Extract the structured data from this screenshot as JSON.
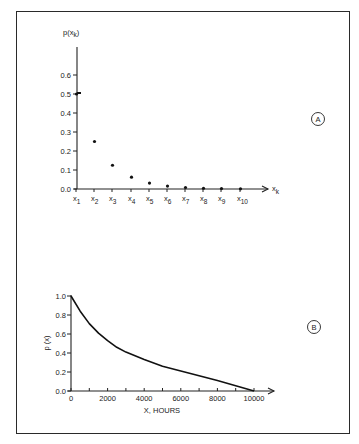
{
  "chart_data": [
    {
      "id": "A",
      "type": "scatter",
      "title": "",
      "panel_label": "A",
      "ylabel": "p(x_k)",
      "ylabel_main": "p(x",
      "ylabel_sub": "k",
      "ylabel_close": ")",
      "xlabel": "x_k",
      "xlabel_main": "x",
      "xlabel_sub": "k",
      "ylim": [
        0,
        0.7
      ],
      "yticks": [
        0.0,
        0.1,
        0.2,
        0.3,
        0.4,
        0.5,
        0.6
      ],
      "ytick_labels": [
        "0.0",
        "0.1",
        "0.2",
        "0.3",
        "0.4",
        "0.5",
        "0.6"
      ],
      "categories": [
        "x1",
        "x2",
        "x3",
        "x4",
        "x5",
        "x6",
        "x7",
        "x8",
        "x9",
        "x10"
      ],
      "category_subs": [
        "1",
        "2",
        "3",
        "4",
        "5",
        "6",
        "7",
        "8",
        "9",
        "10"
      ],
      "values": [
        0.5,
        0.25,
        0.125,
        0.0625,
        0.03125,
        0.0156,
        0.0078,
        0.0039,
        0.002,
        0.001
      ],
      "grid": false
    },
    {
      "id": "B",
      "type": "line",
      "title": "",
      "panel_label": "B",
      "ylabel": "p (x)",
      "xlabel": "X, HOURS",
      "xlim": [
        0,
        10000
      ],
      "ylim": [
        0,
        1.0
      ],
      "xticks": [
        0,
        2000,
        4000,
        6000,
        8000,
        10000
      ],
      "xtick_labels": [
        "0",
        "2000",
        "4000",
        "6000",
        "8000",
        "10000"
      ],
      "yticks": [
        0.0,
        0.2,
        0.4,
        0.6,
        0.8,
        1.0
      ],
      "ytick_labels": [
        "0.0",
        "0.2",
        "0.4",
        "0.6",
        "0.8",
        "1.0"
      ],
      "series": [
        {
          "name": "p(x)",
          "x": [
            0,
            500,
            1000,
            1500,
            2000,
            2500,
            3000,
            4000,
            5000,
            6000,
            7000,
            8000,
            9000,
            10000
          ],
          "y": [
            1.0,
            0.84,
            0.71,
            0.61,
            0.53,
            0.46,
            0.41,
            0.33,
            0.26,
            0.21,
            0.16,
            0.11,
            0.055,
            0.0
          ]
        }
      ],
      "grid": false
    }
  ]
}
